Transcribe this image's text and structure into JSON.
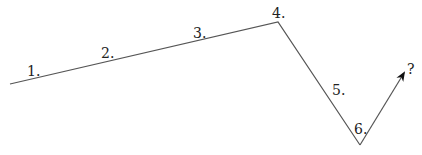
{
  "diagram": {
    "type": "sequence-path",
    "line_color": "#555555",
    "points": [
      {
        "x": 10,
        "y": 84
      },
      {
        "x": 278,
        "y": 22
      },
      {
        "x": 360,
        "y": 145
      },
      {
        "x": 404,
        "y": 73
      }
    ],
    "labels": [
      {
        "text": "1.",
        "x": 27,
        "y": 76
      },
      {
        "text": "2.",
        "x": 101,
        "y": 58
      },
      {
        "text": "3.",
        "x": 193,
        "y": 38
      },
      {
        "text": "4.",
        "x": 272,
        "y": 18
      },
      {
        "text": "5.",
        "x": 332,
        "y": 95
      },
      {
        "text": "6.",
        "x": 354,
        "y": 134
      },
      {
        "text": "?",
        "x": 407,
        "y": 74
      }
    ]
  }
}
